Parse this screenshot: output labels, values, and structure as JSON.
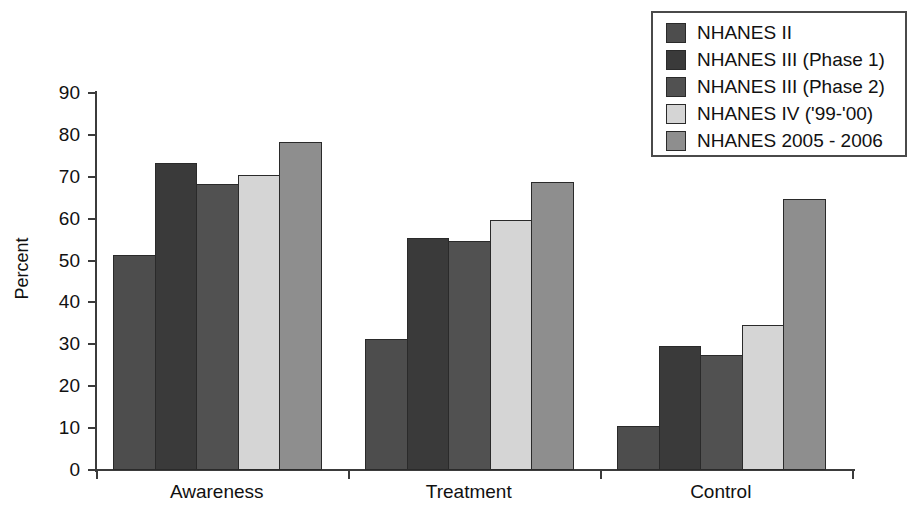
{
  "chart_data": {
    "type": "bar",
    "title": "",
    "xlabel": "",
    "ylabel": "Percent",
    "ylim": [
      0,
      90
    ],
    "yticks": [
      0,
      10,
      20,
      30,
      40,
      50,
      60,
      70,
      80,
      90
    ],
    "ytick_labels": [
      "0",
      "10",
      "20",
      "30",
      "40",
      "50",
      "60",
      "70",
      "80",
      "90"
    ],
    "grid": false,
    "legend_position": "top-right",
    "categories": [
      "Awareness",
      "Treatment",
      "Control"
    ],
    "series": [
      {
        "name": "NHANES II",
        "color": "#4d4d4d",
        "values": [
          51.3,
          31.3,
          10.5
        ]
      },
      {
        "name": "NHANES III (Phase 1)",
        "color": "#3a3a3a",
        "values": [
          73.2,
          55.4,
          29.5
        ]
      },
      {
        "name": "NHANES III (Phase 2)",
        "color": "#515151",
        "values": [
          68.2,
          54.6,
          27.5
        ]
      },
      {
        "name": "NHANES IV ('99-'00)",
        "color": "#d5d5d5",
        "values": [
          70.4,
          59.6,
          34.5
        ]
      },
      {
        "name": "NHANES 2005 - 2006",
        "color": "#8e8e8e",
        "values": [
          78.4,
          68.7,
          64.8
        ]
      }
    ]
  },
  "axes": {
    "y_title": "Percent"
  }
}
